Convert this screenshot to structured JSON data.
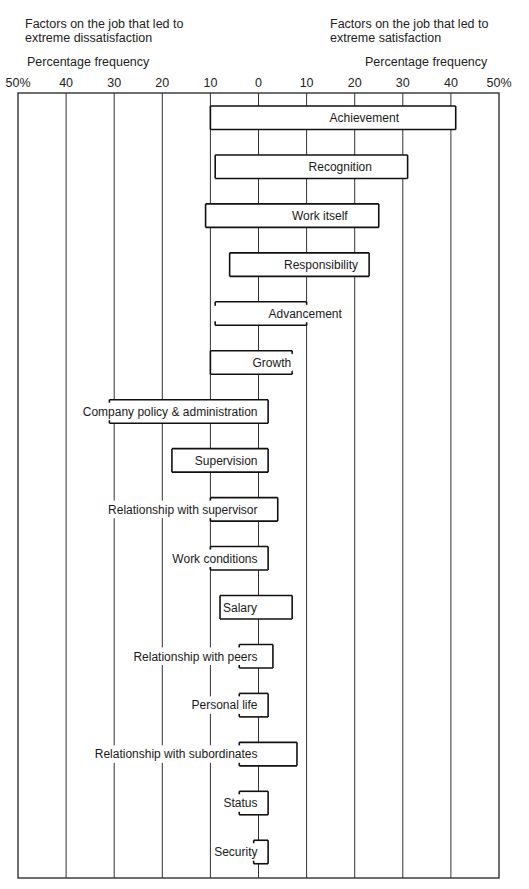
{
  "header": {
    "left_title_line1": "Factors on the job that led to",
    "left_title_line2": "extreme dissatisfaction",
    "right_title_line1": "Factors on the job that led to",
    "right_title_line2": "extreme satisfaction",
    "left_axis_label": "Percentage frequency",
    "right_axis_label": "Percentage frequency"
  },
  "axis": {
    "ticks": [
      "50%",
      "40",
      "30",
      "20",
      "10",
      "0",
      "10",
      "20",
      "30",
      "40",
      "50%"
    ],
    "tick_values": [
      -50,
      -40,
      -30,
      -20,
      -10,
      0,
      10,
      20,
      30,
      40,
      50
    ]
  },
  "chart_data": {
    "type": "bar",
    "orientation": "horizontal-diverging",
    "title": "",
    "xlabel_left": "Percentage frequency (factors that led to extreme dissatisfaction)",
    "xlabel_right": "Percentage frequency (factors that led to extreme satisfaction)",
    "xlim": [
      -50,
      50
    ],
    "grid": true,
    "categories": [
      "Achievement",
      "Recognition",
      "Work itself",
      "Responsibility",
      "Advancement",
      "Growth",
      "Company policy & administration",
      "Supervision",
      "Relationship with supervisor",
      "Work conditions",
      "Salary",
      "Relationship with peers",
      "Personal life",
      "Relationship with subordinates",
      "Status",
      "Security"
    ],
    "series": [
      {
        "name": "Extreme dissatisfaction",
        "values": [
          10,
          9,
          11,
          6,
          9,
          10,
          31,
          18,
          10,
          10,
          8,
          4,
          4,
          4,
          4,
          1
        ]
      },
      {
        "name": "Extreme satisfaction",
        "values": [
          41,
          31,
          25,
          23,
          10,
          7,
          2,
          2,
          4,
          2,
          7,
          3,
          2,
          8,
          2,
          2
        ]
      }
    ],
    "label_side": [
      "right",
      "right",
      "right",
      "right",
      "right",
      "right",
      "left",
      "left",
      "left",
      "left",
      "left",
      "left",
      "left",
      "left",
      "left",
      "left"
    ],
    "open_left_side": [
      false,
      false,
      false,
      false,
      true,
      false,
      false,
      false,
      true,
      true,
      false,
      true,
      true,
      true,
      true,
      true
    ],
    "open_right_side": [
      false,
      false,
      false,
      false,
      false,
      true,
      false,
      false,
      false,
      false,
      false,
      false,
      false,
      false,
      false,
      false
    ]
  }
}
